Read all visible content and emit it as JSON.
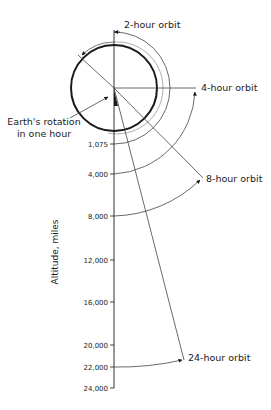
{
  "diagram": {
    "center": {
      "x": 114,
      "y": 88
    },
    "earth_radius_px": 43,
    "colors": {
      "line": "#1a1a1a",
      "thin": "#444444",
      "background": "#ffffff"
    },
    "axis": {
      "title": "Altitude, miles",
      "ticks": [
        {
          "label": "1,075",
          "y": 144
        },
        {
          "label": "4,000",
          "y": 174
        },
        {
          "label": "8,000",
          "y": 216
        },
        {
          "label": "12,000",
          "y": 260
        },
        {
          "label": "16,000",
          "y": 302
        },
        {
          "label": "20,000",
          "y": 345
        },
        {
          "label": "22,000",
          "y": 367
        },
        {
          "label": "24,000",
          "y": 388
        }
      ]
    },
    "orbits": [
      {
        "label": "2-hour orbit",
        "altitude": "1,075"
      },
      {
        "label": "4-hour orbit",
        "altitude": "4,000"
      },
      {
        "label": "8-hour orbit",
        "altitude": "8,000"
      },
      {
        "label": "24-hour orbit",
        "altitude": "22,000"
      }
    ],
    "earth_rotation_label": {
      "line1": "Earth's rotation",
      "line2": "in one hour"
    }
  }
}
